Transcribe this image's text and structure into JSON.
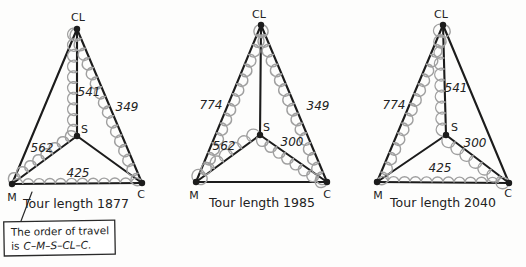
{
  "colors": {
    "ink": "#1c1c1c",
    "coil": "#a0a0a0",
    "paper": "#fdfdfc",
    "text": "#222222"
  },
  "diagrams": [
    {
      "vertex_labels": {
        "cl": "CL",
        "s": "S",
        "m": "M",
        "c": "C"
      },
      "edge_weights": {
        "cl_s": "541",
        "cl_c": "349",
        "m_s": "562",
        "m_c": "425"
      },
      "tour_length": "1877",
      "caption": "Tour length 1877"
    },
    {
      "vertex_labels": {
        "cl": "CL",
        "s": "S",
        "m": "M",
        "c": "C"
      },
      "edge_weights": {
        "m_cl": "774",
        "cl_c": "349",
        "m_s": "562",
        "s_c": "300"
      },
      "tour_length": "1985",
      "caption": "Tour length 1985"
    },
    {
      "vertex_labels": {
        "cl": "CL",
        "s": "S",
        "m": "M",
        "c": "C"
      },
      "edge_weights": {
        "m_cl": "774",
        "cl_s": "541",
        "s_c": "300",
        "m_c": "425"
      },
      "tour_length": "2040",
      "caption": "Tour length 2040"
    }
  ],
  "callout": {
    "line1": "The order of travel",
    "line2_lead": "is",
    "route": "C–M–S–CL–C."
  }
}
